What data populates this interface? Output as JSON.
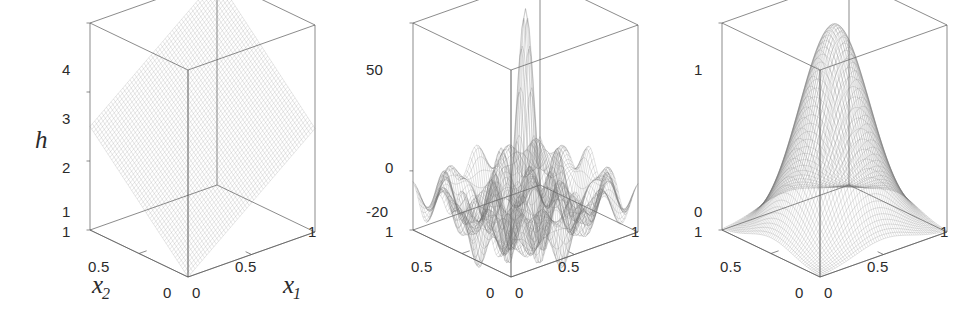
{
  "figure": {
    "background": "#ffffff",
    "ink": "#2b2b2b",
    "mesh_color": "#6e6e6e",
    "box_color": "#555555",
    "width": 974,
    "height": 322,
    "panel_count": 3
  },
  "chart_data": [
    {
      "type": "surface",
      "id": "panel-1",
      "title": "",
      "surface_name": "pyramid-plane",
      "description": "Piecewise-linear pyramid surface rising from the front corner toward the back corner",
      "xlabel": "x₁",
      "ylabel": "x₂",
      "zlabel": "h",
      "xlim": [
        0,
        1
      ],
      "ylim": [
        0,
        1
      ],
      "zlim": [
        1,
        4
      ],
      "xticks": [
        "0",
        "0.5",
        "1"
      ],
      "yticks": [
        "0",
        "0.5",
        "1"
      ],
      "zticks": [
        "1",
        "2",
        "3",
        "4"
      ],
      "grid": false,
      "legend": "none",
      "z_corner_values": {
        "x0_y0": 1,
        "x1_y0": 2.5,
        "x0_y1": 2.5,
        "x1_y1": 4
      },
      "projection": {
        "azimuth_deg": -37.5,
        "elevation_deg": 30
      }
    },
    {
      "type": "surface",
      "id": "panel-2",
      "title": "",
      "surface_name": "rastrigin-ripple",
      "description": "Highly multimodal oscillating surface with many ripples and a single tall central spike",
      "xlabel": "",
      "ylabel": "",
      "zlabel": "",
      "xlim": [
        0,
        1
      ],
      "ylim": [
        0,
        1
      ],
      "zlim": [
        -20,
        50
      ],
      "xticks": [
        "0",
        "0.5",
        "1"
      ],
      "yticks": [
        "0",
        "0.5",
        "1"
      ],
      "zticks": [
        "-20",
        "0",
        "50"
      ],
      "grid": false,
      "legend": "none",
      "peak_value": 50,
      "peak_location": [
        0.5,
        0.5
      ],
      "ripple_amplitude": 12,
      "ripple_frequency": 4,
      "projection": {
        "azimuth_deg": -37.5,
        "elevation_deg": 30
      }
    },
    {
      "type": "surface",
      "id": "panel-3",
      "title": "",
      "surface_name": "gaussian-bell",
      "description": "Smooth single-peaked Gaussian bell surface centred in the domain",
      "xlabel": "",
      "ylabel": "",
      "zlabel": "",
      "xlim": [
        0,
        1
      ],
      "ylim": [
        0,
        1
      ],
      "zlim": [
        0,
        1
      ],
      "xticks": [
        "0",
        "0.5",
        "1"
      ],
      "yticks": [
        "0",
        "0.5",
        "1"
      ],
      "zticks": [
        "0",
        "1"
      ],
      "grid": false,
      "legend": "none",
      "peak_value": 1,
      "peak_location": [
        0.5,
        0.5
      ],
      "sigma": 0.22,
      "projection": {
        "azimuth_deg": -37.5,
        "elevation_deg": 30
      }
    }
  ],
  "panels": [
    {
      "name": "panel-1",
      "zaxis": {
        "ticks": [
          "4",
          "3",
          "2",
          "1"
        ],
        "label": "h"
      },
      "yaxis": {
        "ticks": [
          "1",
          "0.5",
          "0"
        ],
        "label": "x",
        "sub": "2"
      },
      "xaxis": {
        "ticks": [
          "0",
          "0.5",
          "1"
        ],
        "label": "x",
        "sub": "1"
      }
    },
    {
      "name": "panel-2",
      "zaxis": {
        "ticks": [
          "50",
          "0",
          "-20"
        ],
        "label": ""
      },
      "yaxis": {
        "ticks": [
          "1",
          "0.5",
          "0"
        ],
        "label": "",
        "sub": ""
      },
      "xaxis": {
        "ticks": [
          "0",
          "0.5",
          "1"
        ],
        "label": "",
        "sub": ""
      }
    },
    {
      "name": "panel-3",
      "zaxis": {
        "ticks": [
          "1",
          "0"
        ],
        "label": ""
      },
      "yaxis": {
        "ticks": [
          "1",
          "0.5",
          "0"
        ],
        "label": "",
        "sub": ""
      },
      "xaxis": {
        "ticks": [
          "0",
          "0.5",
          "1"
        ],
        "label": "",
        "sub": ""
      }
    }
  ]
}
